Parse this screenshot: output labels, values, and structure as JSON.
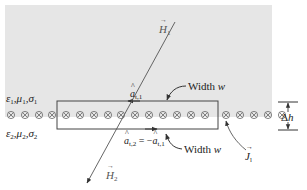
{
  "diagram": {
    "title": "",
    "colors": {
      "region1_fill": "#e6e6e6",
      "region2_fill": "#ffffff",
      "line_color": "#444444",
      "text_color": "#222222"
    },
    "regions": {
      "upper": {
        "label_main": "ε",
        "label_parts": [
          "ε",
          "1",
          ",μ",
          "1",
          ",σ",
          "1"
        ]
      },
      "lower": {
        "label_parts": [
          "ε",
          "2",
          ",μ",
          "2",
          ",σ",
          "2"
        ]
      }
    },
    "field_vectors": {
      "h1": {
        "symbol": "H",
        "subscript": "1"
      },
      "h2": {
        "symbol": "H",
        "subscript": "2"
      }
    },
    "unit_vectors": {
      "at1": {
        "symbol": "a",
        "subscript": "t,1"
      },
      "at2": {
        "symbol": "a",
        "subscript": "t,2",
        "equals_text": " = −",
        "rhs_symbol": "a",
        "rhs_subscript": "t,1"
      }
    },
    "width_labels": {
      "top": {
        "text": "Width ",
        "var": "w"
      },
      "bottom": {
        "text": "Width ",
        "var": "w"
      }
    },
    "surface_current": {
      "symbol": "J",
      "subscript": "l",
      "marker_glyph": "⊗",
      "marker_count": 20
    },
    "thickness": {
      "delta": "Δ",
      "var": "h"
    }
  }
}
